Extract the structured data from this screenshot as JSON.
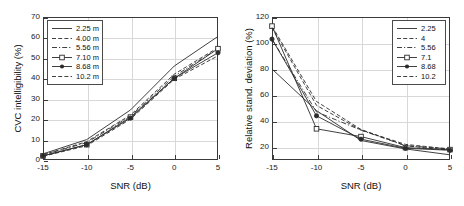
{
  "figure": {
    "panels": [
      "left",
      "right"
    ]
  },
  "chart_data": [
    {
      "type": "line",
      "panel": "left",
      "title": "",
      "xlabel": "SNR (dB)",
      "ylabel": "CVC intelligibility (%)",
      "x": [
        -15,
        -10,
        -5,
        0,
        5
      ],
      "xticklabels": [
        "-15",
        "-10",
        "-5",
        "0",
        "5"
      ],
      "yticks": [
        0,
        10,
        20,
        30,
        40,
        50,
        60,
        70
      ],
      "yticklabels": [
        "0",
        "10",
        "20",
        "30",
        "40",
        "50",
        "60",
        "70"
      ],
      "xlim": [
        -15,
        5
      ],
      "ylim": [
        0,
        70
      ],
      "grid": true,
      "legend_position": "top-left",
      "series": [
        {
          "name": "2.25 m",
          "style": "solid",
          "marker": "none",
          "values": [
            3.0,
            10.0,
            24.5,
            46.0,
            60.5
          ]
        },
        {
          "name": "4.00 m",
          "style": "dashed",
          "marker": "none",
          "values": [
            2.5,
            9.0,
            22.0,
            42.0,
            55.0
          ]
        },
        {
          "name": "5.56 m",
          "style": "dashdot",
          "marker": "none",
          "values": [
            2.5,
            8.5,
            21.5,
            41.0,
            54.5
          ]
        },
        {
          "name": "7.10 m",
          "style": "solid",
          "marker": "square",
          "values": [
            2.0,
            7.5,
            21.0,
            40.0,
            54.5
          ]
        },
        {
          "name": "8.68 m",
          "style": "solid",
          "marker": "circle",
          "values": [
            2.0,
            7.5,
            20.5,
            40.0,
            52.5
          ]
        },
        {
          "name": "10.2 m",
          "style": "dashed",
          "marker": "none",
          "values": [
            1.8,
            7.0,
            20.0,
            39.5,
            51.0
          ]
        }
      ]
    },
    {
      "type": "line",
      "panel": "right",
      "title": "",
      "xlabel": "SNR (dB)",
      "ylabel": "Relative stand. deviation (%)",
      "x": [
        -15,
        -10,
        -5,
        0,
        5
      ],
      "xticklabels": [
        "-15",
        "-10",
        "-5",
        "0",
        "5"
      ],
      "yticks": [
        20,
        40,
        60,
        80,
        100,
        120
      ],
      "yticklabels": [
        "20",
        "40",
        "60",
        "80",
        "100",
        "120"
      ],
      "xlim": [
        -15,
        5
      ],
      "ylim": [
        10,
        120
      ],
      "grid": true,
      "legend_position": "top-right",
      "series": [
        {
          "name": "2.25",
          "style": "solid",
          "marker": "none",
          "values": [
            80.0,
            48.0,
            25.0,
            18.5,
            14.0
          ]
        },
        {
          "name": "4",
          "style": "dashed",
          "marker": "none",
          "values": [
            113.0,
            55.0,
            33.5,
            21.0,
            17.5
          ]
        },
        {
          "name": "5.56",
          "style": "dashdot",
          "marker": "none",
          "values": [
            103.0,
            47.0,
            33.0,
            21.0,
            18.5
          ]
        },
        {
          "name": "7.1",
          "style": "solid",
          "marker": "square",
          "values": [
            113.0,
            34.0,
            28.0,
            19.5,
            18.0
          ]
        },
        {
          "name": "8.68",
          "style": "solid",
          "marker": "circle",
          "values": [
            103.0,
            44.0,
            26.0,
            19.0,
            17.5
          ]
        },
        {
          "name": "10.2",
          "style": "dashed",
          "marker": "none",
          "values": [
            112.0,
            52.0,
            33.0,
            22.0,
            18.5
          ]
        }
      ]
    }
  ]
}
